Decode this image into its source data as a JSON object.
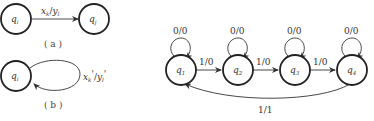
{
  "panel_a": {
    "from_state": {
      "main": "q",
      "sub": "i"
    },
    "to_state": {
      "main": "q",
      "sub": "j"
    },
    "edge_label": {
      "x": "x",
      "xs": "k",
      "slash": "/",
      "y": "y",
      "ys": "l"
    },
    "caption": "( a )"
  },
  "panel_b": {
    "state": {
      "main": "q",
      "sub": "i"
    },
    "loop_label": {
      "x": "x",
      "xs": "k",
      "xp": "'",
      "slash": "/",
      "y": "y",
      "ys": "l",
      "yp": "'"
    },
    "caption": "( b )"
  },
  "fsm": {
    "states": [
      {
        "main": "q",
        "sub": "1",
        "self_loop": "0/0"
      },
      {
        "main": "q",
        "sub": "2",
        "self_loop": "0/0"
      },
      {
        "main": "q",
        "sub": "3",
        "self_loop": "0/0"
      },
      {
        "main": "q",
        "sub": "4",
        "self_loop": "0/0"
      }
    ],
    "forward_edges": [
      "1/0",
      "1/0",
      "1/0"
    ],
    "return_edge": "1/1"
  }
}
